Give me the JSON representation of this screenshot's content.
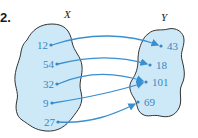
{
  "problem_number": "2.",
  "sets": {
    "domain": {
      "label": "X",
      "elements": [
        "12",
        "54",
        "32",
        "9",
        "27"
      ]
    },
    "codomain": {
      "label": "Y",
      "elements": [
        "43",
        "18",
        "101",
        "69"
      ]
    }
  },
  "mapping": [
    {
      "from": "12",
      "to": "43"
    },
    {
      "from": "54",
      "to": "18"
    },
    {
      "from": "32",
      "to": "101"
    },
    {
      "from": "9",
      "to": "101"
    },
    {
      "from": "27",
      "to": "69"
    }
  ],
  "colors": {
    "blob_fill": "#cde9f7",
    "blob_stroke": "#333333",
    "arrow": "#3a8fd0",
    "label_text": "#3a86c0"
  }
}
